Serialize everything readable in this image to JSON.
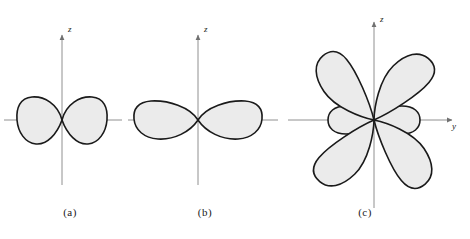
{
  "figure": {
    "background_color": "#ffffff",
    "lobe_fill_color": "#ebebeb",
    "lobe_stroke_color": "#1a1a1a",
    "axis_color": "#808080",
    "text_color": "#1a1a1a"
  },
  "panels": [
    {
      "id": "a",
      "caption": "(a)",
      "origin": {
        "x": 62,
        "y": 120
      },
      "axes": [
        {
          "name": "z",
          "label": "z",
          "direction": "up",
          "label_x": 68,
          "label_y": 28
        }
      ],
      "shape": {
        "type": "two-lobe",
        "lobe_count": 2,
        "orientation": "horizontal",
        "lobe_half_length": 44,
        "lobe_half_width": 23
      }
    },
    {
      "id": "b",
      "caption": "(b)",
      "origin": {
        "x": 198,
        "y": 120
      },
      "axes": [
        {
          "name": "z",
          "label": "z",
          "direction": "up",
          "label_x": 204,
          "label_y": 28
        }
      ],
      "shape": {
        "type": "two-lobe",
        "lobe_count": 2,
        "orientation": "horizontal",
        "lobe_half_length": 64,
        "lobe_half_width": 18
      }
    },
    {
      "id": "c",
      "caption": "(c)",
      "origin": {
        "x": 374,
        "y": 120
      },
      "axes": [
        {
          "name": "z",
          "label": "z",
          "direction": "up",
          "label_x": 380,
          "label_y": 18
        },
        {
          "name": "y",
          "label": "y",
          "direction": "right",
          "label_x": 452,
          "label_y": 128
        }
      ],
      "shape": {
        "type": "six-lobe",
        "lobe_count": 6,
        "orientation": "four-diagonal-two-horizontal",
        "diagonal_lobe_length": 78,
        "diagonal_lobe_width": 30,
        "diagonal_angles": [
          50,
          130,
          230,
          310
        ],
        "horizontal_lobe_length": 46,
        "horizontal_lobe_width": 17
      }
    }
  ],
  "axis_labels": {
    "z": "z",
    "y": "y"
  }
}
